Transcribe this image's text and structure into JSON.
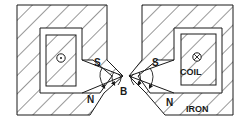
{
  "figure": {
    "type": "magnet pole pieces cross-section",
    "labels": {
      "left_south": "S",
      "left_north": "N",
      "right_south": "S",
      "right_north": "N",
      "field": "B",
      "coil": "COIL",
      "iron": "IRON"
    },
    "symbols": {
      "left_coil_current": "dot (current out of page)",
      "right_coil_current": "cross (current into page)"
    },
    "colors": {
      "ink": "#1a1a1a",
      "background": "#ffffff"
    }
  }
}
